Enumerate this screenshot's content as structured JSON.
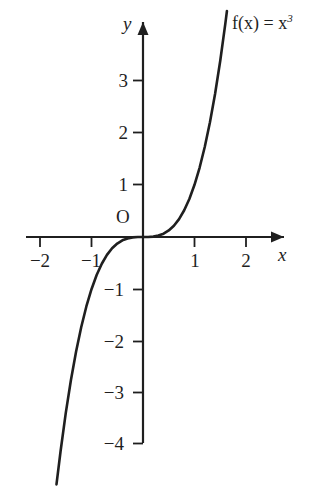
{
  "chart_data": {
    "type": "line",
    "title": "",
    "function_label": "f(x) = x",
    "function_exponent": "3",
    "expression": "f(x) = x^3",
    "xlabel": "x",
    "ylabel": "y",
    "origin_label": "O",
    "xlim": [
      -2.25,
      2.35
    ],
    "ylim": [
      -4.3,
      4.0
    ],
    "grid": false,
    "legend": false,
    "x_ticks": [
      -2,
      -1,
      1,
      2
    ],
    "x_tick_labels": [
      "−2",
      "−1",
      "1",
      "2"
    ],
    "y_ticks": [
      3,
      2,
      1,
      -1,
      -2,
      -3,
      -4
    ],
    "y_tick_labels": [
      "3",
      "2",
      "1",
      "−1",
      "−2",
      "−3",
      "−4"
    ],
    "series": [
      {
        "name": "f(x) = x^3",
        "color": "#1f1f1f",
        "x": [
          -1.68,
          -1.6,
          -1.5,
          -1.4,
          -1.3,
          -1.2,
          -1.1,
          -1.0,
          -0.9,
          -0.8,
          -0.7,
          -0.6,
          -0.5,
          -0.4,
          -0.3,
          -0.2,
          -0.1,
          0.0,
          0.1,
          0.2,
          0.3,
          0.4,
          0.5,
          0.6,
          0.7,
          0.8,
          0.9,
          1.0,
          1.1,
          1.2,
          1.3,
          1.4,
          1.5,
          1.6,
          1.63
        ],
        "y": [
          -4.74,
          -4.1,
          -3.375,
          -2.744,
          -2.197,
          -1.728,
          -1.331,
          -1.0,
          -0.729,
          -0.512,
          -0.343,
          -0.216,
          -0.125,
          -0.064,
          -0.027,
          -0.008,
          -0.001,
          0.0,
          0.001,
          0.008,
          0.027,
          0.064,
          0.125,
          0.216,
          0.343,
          0.512,
          0.729,
          1.0,
          1.331,
          1.728,
          2.197,
          2.744,
          3.375,
          4.096,
          4.33
        ]
      }
    ],
    "axis_color": "#1f1f1f",
    "background": "#ffffff"
  }
}
